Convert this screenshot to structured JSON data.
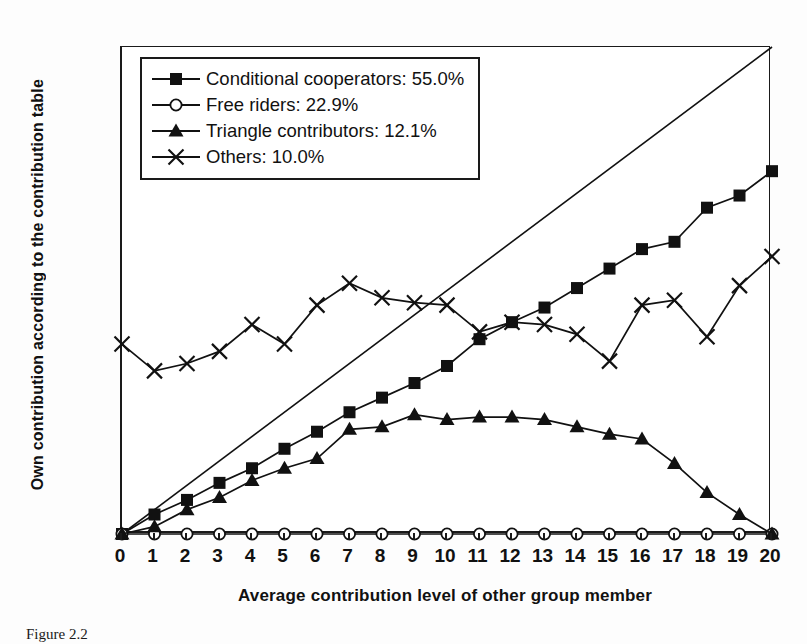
{
  "figure": {
    "caption": "Figure 2.2"
  },
  "chart_data": {
    "type": "line",
    "title": "",
    "xlabel": "Average contribution level of other group member",
    "ylabel": "Own contribution according to the contribution table",
    "xlim": [
      0,
      20
    ],
    "ylim": [
      0,
      20
    ],
    "xticks": [
      0,
      1,
      2,
      3,
      4,
      5,
      6,
      7,
      8,
      9,
      10,
      11,
      12,
      13,
      14,
      15,
      16,
      17,
      18,
      19,
      20
    ],
    "yticks": [
      0,
      2,
      4,
      6,
      8,
      10,
      12,
      14,
      16,
      18,
      20
    ],
    "xtick_labels": [
      "0",
      "1",
      "2",
      "3",
      "4",
      "5",
      "6",
      "7",
      "8",
      "9",
      "10",
      "11",
      "12",
      "13",
      "14",
      "15",
      "16",
      "17",
      "18",
      "19",
      "20"
    ],
    "ytick_labels": [
      "0",
      "2",
      "4",
      "6",
      "8",
      "10",
      "12",
      "14",
      "16",
      "18",
      "20"
    ],
    "grid": false,
    "legend_position": "upper-left",
    "x": [
      0,
      1,
      2,
      3,
      4,
      5,
      6,
      7,
      8,
      9,
      10,
      11,
      12,
      13,
      14,
      15,
      16,
      17,
      18,
      19,
      20
    ],
    "series": [
      {
        "name": "Conditional cooperators: 55.0%",
        "short_name": "Conditional cooperators",
        "percent": "55.0%",
        "marker": "filled-square",
        "color": "#111111",
        "values": [
          0.0,
          0.8,
          1.4,
          2.1,
          2.7,
          3.5,
          4.2,
          5.0,
          5.6,
          6.2,
          6.9,
          8.0,
          8.7,
          9.3,
          10.1,
          10.9,
          11.7,
          12.0,
          13.4,
          13.9,
          14.9
        ]
      },
      {
        "name": "Free riders: 22.9%",
        "short_name": "Free riders",
        "percent": "22.9%",
        "marker": "open-circle",
        "color": "#111111",
        "values": [
          0.0,
          0.0,
          0.0,
          0.0,
          0.0,
          0.0,
          0.0,
          0.0,
          0.0,
          0.0,
          0.0,
          0.0,
          0.0,
          0.0,
          0.0,
          0.0,
          0.0,
          0.0,
          0.0,
          0.0,
          0.0
        ]
      },
      {
        "name": "Triangle contributors: 12.1%",
        "short_name": "Triangle contributors",
        "percent": "12.1%",
        "marker": "filled-triangle",
        "color": "#111111",
        "values": [
          0.0,
          0.3,
          1.0,
          1.5,
          2.2,
          2.7,
          3.1,
          4.3,
          4.4,
          4.9,
          4.7,
          4.8,
          4.8,
          4.7,
          4.4,
          4.1,
          3.9,
          2.9,
          1.7,
          0.8,
          0.0
        ]
      },
      {
        "name": "Others: 10.0%",
        "short_name": "Others",
        "percent": "10.0%",
        "marker": "cross-x",
        "color": "#111111",
        "values": [
          7.8,
          6.7,
          7.0,
          7.5,
          8.6,
          7.8,
          9.4,
          10.3,
          9.7,
          9.5,
          9.4,
          8.3,
          8.7,
          8.6,
          8.2,
          7.1,
          9.4,
          9.6,
          8.1,
          10.2,
          11.4
        ]
      }
    ],
    "reference_line": {
      "name": "45-degree line",
      "from": [
        0,
        0
      ],
      "to": [
        20,
        20
      ],
      "color": "#111111"
    }
  }
}
